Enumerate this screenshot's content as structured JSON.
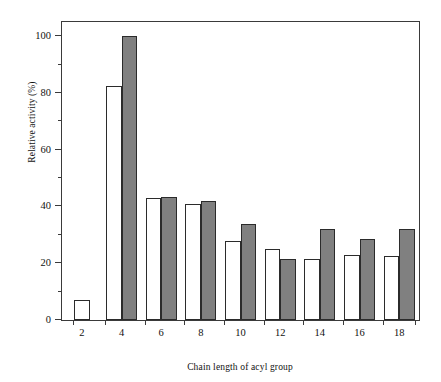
{
  "chart_data": {
    "type": "bar",
    "title": "",
    "subtitle": "",
    "xlabel": "Chain length of acyl group",
    "ylabel": "Relative activity (%)",
    "categories": [
      "2",
      "4",
      "6",
      "8",
      "10",
      "12",
      "14",
      "16",
      "18"
    ],
    "series": [
      {
        "name": "open",
        "style": "open-white-bar",
        "color": "#ffffff",
        "values": [
          7,
          82.5,
          43,
          41,
          28,
          25,
          21.5,
          23,
          22.5
        ]
      },
      {
        "name": "filled",
        "style": "filled-gray-bar",
        "color": "#808080",
        "values": [
          null,
          100,
          43.5,
          42,
          34,
          21.5,
          32,
          28.5,
          32
        ]
      }
    ],
    "ylim": [
      0,
      105
    ],
    "yticks": [
      0,
      20,
      40,
      60,
      80,
      100
    ],
    "ytick_labels": [
      "0",
      "20",
      "40",
      "60",
      "80",
      "100"
    ],
    "yminor_ticks": [
      10,
      30,
      50,
      70,
      90
    ],
    "xticks": [
      "2",
      "4",
      "6",
      "8",
      "10",
      "12",
      "14",
      "16",
      "18"
    ],
    "grid": false,
    "legend": "none",
    "axis_color": "#3a3a3a",
    "bar_edge_color": "#2b2b2b"
  },
  "figure": {
    "y_axis_title": "Relative activity (%)",
    "x_axis_title": "Chain length of acyl group"
  }
}
